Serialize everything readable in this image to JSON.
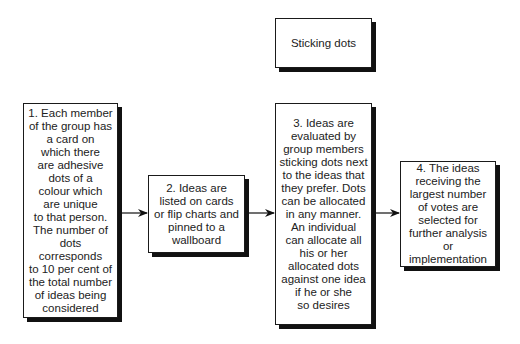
{
  "diagram": {
    "title_box": {
      "label": "Sticking dots"
    },
    "steps": [
      {
        "id": 1,
        "text": "1. Each member\nof the group has\na card on\nwhich there\nare adhesive\ndots of a\ncolour which\nare unique\nto that person.\nThe number of\ndots corresponds\nto 10 per cent of\nthe total number\nof ideas being\nconsidered"
      },
      {
        "id": 2,
        "text": "2. Ideas are\nlisted on cards\nor flip charts and\npinned to a\nwallboard"
      },
      {
        "id": 3,
        "text": "3. Ideas are\nevaluated by\ngroup members\nsticking dots next\nto the ideas that\nthey prefer. Dots\ncan be allocated\nin any manner.\nAn individual\ncan allocate all\nhis or her\nallocated dots\nagainst one idea\nif he or she\nso desires"
      },
      {
        "id": 4,
        "text": "4. The ideas\nreceiving the\nlargest number\nof votes are\nselected for\nfurther analysis\nor implementation"
      }
    ],
    "connections": [
      {
        "from": 1,
        "to": 2
      },
      {
        "from": 2,
        "to": 3
      },
      {
        "from": 3,
        "to": 4
      }
    ],
    "colors": {
      "border": "#1a1a1a",
      "shadow": "#111111",
      "text": "#222222",
      "background": "#ffffff"
    }
  }
}
